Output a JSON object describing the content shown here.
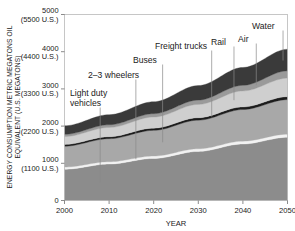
{
  "chart_data": {
    "type": "area",
    "title": "",
    "xlabel": "YEAR",
    "ylabel": "ENERGY CONSUMPTION METRIC MEGATONS OIL EQUIVALENT (U.S. MEGATONS)",
    "ylabel_line1": "ENERGY CONSUMPTION METRIC MEGATONS OIL",
    "ylabel_line2": "EQUIVALENT (U.S. MEGATONS)",
    "stacked": true,
    "grid": false,
    "legend_position": "inline-annotations",
    "xlim": [
      2000,
      2050
    ],
    "ylim": [
      0,
      5000
    ],
    "x": [
      2000,
      2010,
      2020,
      2030,
      2040,
      2050
    ],
    "xticks": [
      "2000",
      "2010",
      "2020",
      "2030",
      "2040",
      "2050"
    ],
    "yticks": [
      {
        "value": 5000,
        "label": "5000",
        "sublabel": "(5500 U.S.)"
      },
      {
        "value": 4000,
        "label": "4000",
        "sublabel": "(4400 U.S.)"
      },
      {
        "value": 3000,
        "label": "3000",
        "sublabel": "(3300 U.S.)"
      },
      {
        "value": 2000,
        "label": "2000",
        "sublabel": "(2200 U.S.)"
      },
      {
        "value": 1000,
        "label": "1000",
        "sublabel": "(1100 U.S.)"
      },
      {
        "value": 0,
        "label": "0",
        "sublabel": ""
      }
    ],
    "series": [
      {
        "name": "Light duty vehicles",
        "color": "#8c8c8c",
        "values": [
          840,
          980,
          1130,
          1320,
          1520,
          1700
        ]
      },
      {
        "name": "2–3 wheelers",
        "color": "#f2f2f2",
        "values": [
          60,
          62,
          66,
          70,
          76,
          82
        ]
      },
      {
        "name": "Buses",
        "color": "#a8a8a8",
        "values": [
          560,
          620,
          690,
          770,
          850,
          930
        ]
      },
      {
        "name": "Freight trucks",
        "color": "#1c1c1c",
        "values": [
          48,
          52,
          58,
          64,
          70,
          78
        ]
      },
      {
        "name": "Rail",
        "color": "#cfcfcf",
        "values": [
          210,
          250,
          300,
          360,
          430,
          500
        ]
      },
      {
        "name": "Air",
        "color": "#9a9a9a",
        "values": [
          60,
          72,
          90,
          115,
          150,
          195
        ]
      },
      {
        "name": "Water",
        "color": "#3a3a3a",
        "values": [
          230,
          270,
          320,
          390,
          480,
          580
        ]
      }
    ],
    "totals": [
      2008,
      2306,
      2654,
      3089,
      3576,
      4065
    ],
    "annotations": [
      {
        "id": "light-duty-vehicles",
        "label_line1": "Light duty",
        "label_line2": "vehicles",
        "text": "Light duty vehicles",
        "year": 2008
      },
      {
        "id": "two-three-wheelers",
        "label_line1": "2–3 wheelers",
        "label_line2": "",
        "text": "2–3 wheelers",
        "year": 2016
      },
      {
        "id": "buses",
        "label_line1": "Buses",
        "label_line2": "",
        "text": "Buses",
        "year": 2022
      },
      {
        "id": "freight-trucks",
        "label_line1": "Freight trucks",
        "label_line2": "",
        "text": "Freight trucks",
        "year": 2033
      },
      {
        "id": "rail",
        "label_line1": "Rail",
        "label_line2": "",
        "text": "Rail",
        "year": 2038
      },
      {
        "id": "air",
        "label_line1": "Air",
        "label_line2": "",
        "text": "Air",
        "year": 2043
      },
      {
        "id": "water",
        "label_line1": "Water",
        "label_line2": "",
        "text": "Water",
        "year": 2049
      }
    ]
  }
}
